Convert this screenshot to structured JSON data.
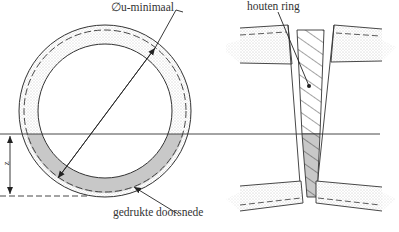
{
  "diagram": {
    "labels": {
      "diameter": "∅u-minimaal",
      "wood_ring": "houten ring",
      "compressed_section": "gedrukte doorsnede",
      "dimension_z": "z"
    },
    "colors": {
      "line": "#333333",
      "stipple": "#9a9a9a",
      "compressed_fill": "#c8c8c8",
      "background": "#ffffff"
    },
    "elements": {
      "left_view": "circular pipe cross-section with stippled wall, dashed mid-wall line, grey compressed lower zone",
      "right_view": "two pipe ends at an angle with a hatched wooden ring between them, lower part grey (compressed)"
    }
  }
}
